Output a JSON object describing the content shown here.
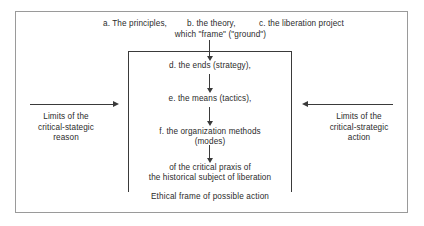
{
  "diagram": {
    "title_row": {
      "a": "a. The principles,",
      "b": "b. the theory,",
      "c": "c. the liberation project",
      "subtitle": "which \"frame\" (\"ground\")"
    },
    "nodes": {
      "d": "d. the ends (strategy),",
      "e": "e. the means (tactics),",
      "f_line1": "f. the organization methods",
      "f_line2": "(modes)",
      "g_line1": "of the critical praxis of",
      "g_line2": "the historical subject of liberation"
    },
    "inner_frame_caption": "Ethical frame of possible action",
    "left_caption": {
      "line1": "Limits of the",
      "line2": "critical-stategic",
      "line3": "reason"
    },
    "right_caption": {
      "line1": "Limits of the",
      "line2": "critical-strategic",
      "line3": "action"
    },
    "colors": {
      "outer_border": "#9a9a9a",
      "inner_border": "#3a3a3a",
      "text": "#2b2b2b",
      "background": "#ffffff"
    }
  }
}
